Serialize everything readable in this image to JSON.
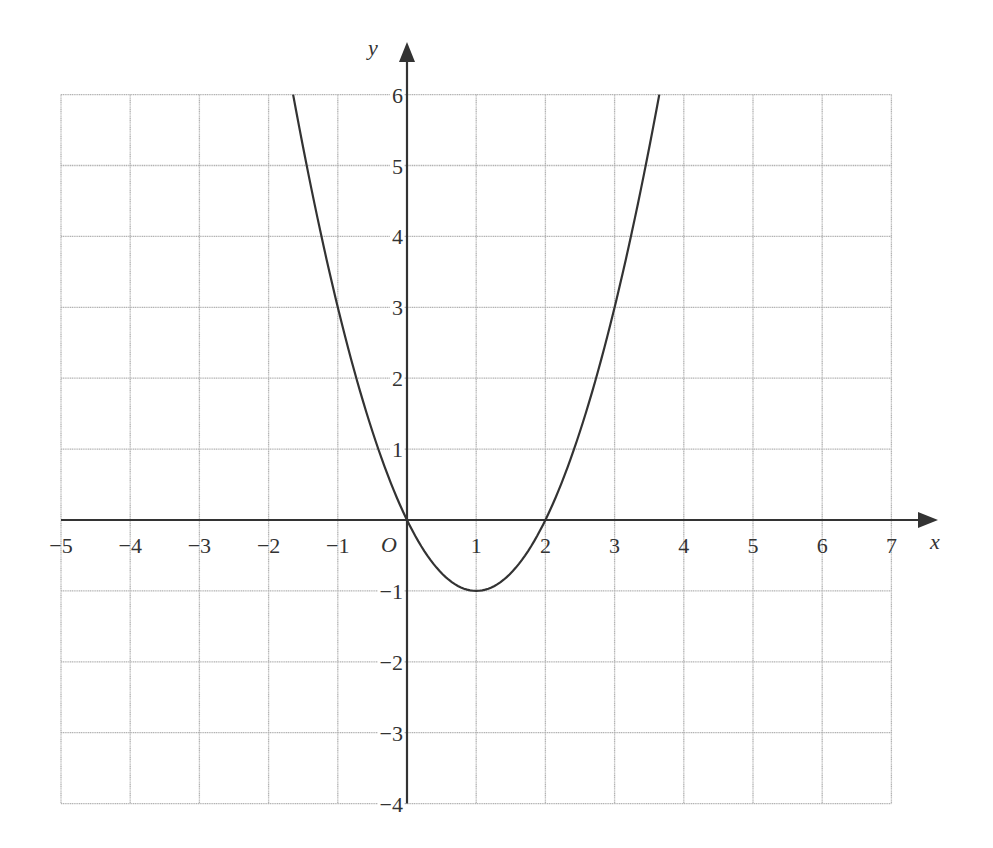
{
  "chart_data": {
    "type": "line",
    "title": "",
    "function": "y = x^2 - 2x",
    "xlabel": "x",
    "ylabel": "y",
    "origin_label": "O",
    "xlim": [
      -5,
      7
    ],
    "ylim": [
      -4,
      6
    ],
    "grid": true,
    "legend": null,
    "x_ticks": [
      -5,
      -4,
      -3,
      -2,
      -1,
      1,
      2,
      3,
      4,
      5,
      6,
      7
    ],
    "x_tick_labels": [
      "−5",
      "−4",
      "−3",
      "−2",
      "−1",
      "1",
      "2",
      "3",
      "4",
      "5",
      "6",
      "7"
    ],
    "y_ticks": [
      6,
      5,
      4,
      3,
      2,
      1,
      -1,
      -2,
      -3,
      -4
    ],
    "y_tick_labels": [
      "6",
      "5",
      "4",
      "3",
      "2",
      "1",
      "−1",
      "−2",
      "−3",
      "−4"
    ],
    "series": [
      {
        "name": "parabola",
        "x": [
          -1.646,
          -1.5,
          -1,
          -0.5,
          0,
          0.5,
          1,
          1.5,
          2,
          2.5,
          3,
          3.5,
          3.646
        ],
        "y": [
          6,
          5.25,
          3,
          1.25,
          0,
          -0.75,
          -1,
          -0.75,
          0,
          1.25,
          3,
          5.25,
          6
        ]
      }
    ],
    "key_points": {
      "vertex": [
        1,
        -1
      ],
      "x_intercepts": [
        [
          0,
          0
        ],
        [
          2,
          0
        ]
      ]
    }
  },
  "colors": {
    "grid": "#b3b3b3",
    "axis": "#333333",
    "curve": "#333333",
    "background": "#ffffff"
  }
}
